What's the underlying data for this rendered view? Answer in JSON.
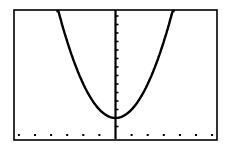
{
  "chart_data": {
    "type": "line",
    "title": "",
    "xlabel": "",
    "ylabel": "",
    "function": "y = x^2 + 2",
    "series": [
      {
        "name": "Y1",
        "x": [
          -3.6,
          -3.0,
          -2.5,
          -2.0,
          -1.5,
          -1.0,
          -0.5,
          0,
          0.5,
          1.0,
          1.5,
          2.0,
          2.5,
          3.0,
          3.6
        ],
        "values": [
          14.96,
          11.0,
          8.25,
          6.0,
          4.25,
          3.0,
          2.25,
          2.0,
          2.25,
          3.0,
          4.25,
          6.0,
          8.25,
          11.0,
          14.96
        ]
      }
    ],
    "xlim": [
      -6.2,
      6.4
    ],
    "ylim": [
      -0.7,
      14.6
    ],
    "xscl": 1,
    "yscl": 1,
    "grid": false,
    "legend": "none",
    "colors": {
      "curve": "#000000",
      "axes": "#000000",
      "frame": "#000000",
      "background": "#ffffff"
    }
  },
  "screen": {
    "frame": {
      "left": 14,
      "top": 10,
      "right": 217,
      "bottom": 140
    },
    "origin_px": {
      "x": 115.5,
      "y": 135
    },
    "px_per_x_unit": 16.1,
    "px_per_y_unit": 8.5
  }
}
